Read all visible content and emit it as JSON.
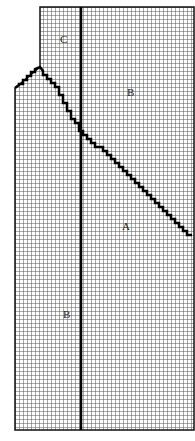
{
  "diagram": {
    "type": "grid-region-diagram",
    "grid": {
      "cell_size": 4,
      "line_color": "#555555",
      "background": "#ffffff",
      "outline_color": "#111111"
    },
    "outline_points": "40,7 194,7 194,430 15,430 15,88 40,67",
    "staircase": {
      "points": [
        [
          15,
          88
        ],
        [
          19,
          85
        ],
        [
          19,
          84
        ],
        [
          23,
          84
        ],
        [
          23,
          80
        ],
        [
          27,
          80
        ],
        [
          27,
          76
        ],
        [
          31,
          76
        ],
        [
          31,
          72
        ],
        [
          35,
          72
        ],
        [
          35,
          69
        ],
        [
          40,
          67
        ],
        [
          43,
          71
        ],
        [
          43,
          75
        ],
        [
          47,
          75
        ],
        [
          47,
          79
        ],
        [
          51,
          79
        ],
        [
          51,
          83
        ],
        [
          55,
          83
        ],
        [
          55,
          87
        ],
        [
          59,
          87
        ],
        [
          59,
          95
        ],
        [
          63,
          95
        ],
        [
          63,
          103
        ],
        [
          67,
          103
        ],
        [
          67,
          111
        ],
        [
          71,
          111
        ],
        [
          71,
          119
        ],
        [
          75,
          119
        ],
        [
          75,
          123
        ],
        [
          79,
          123
        ],
        [
          79,
          131
        ],
        [
          83,
          131
        ],
        [
          83,
          135
        ],
        [
          87,
          135
        ],
        [
          87,
          139
        ],
        [
          91,
          139
        ],
        [
          91,
          143
        ],
        [
          95,
          143
        ],
        [
          95,
          147
        ],
        [
          103,
          147
        ],
        [
          103,
          151
        ],
        [
          107,
          151
        ],
        [
          107,
          155
        ],
        [
          111,
          155
        ],
        [
          111,
          159
        ],
        [
          115,
          159
        ],
        [
          115,
          163
        ],
        [
          119,
          163
        ],
        [
          119,
          167
        ],
        [
          123,
          167
        ],
        [
          123,
          171
        ],
        [
          127,
          171
        ],
        [
          127,
          175
        ],
        [
          131,
          175
        ],
        [
          131,
          179
        ],
        [
          135,
          179
        ],
        [
          135,
          183
        ],
        [
          139,
          183
        ],
        [
          139,
          187
        ],
        [
          143,
          187
        ],
        [
          143,
          191
        ],
        [
          147,
          191
        ],
        [
          147,
          195
        ],
        [
          151,
          195
        ],
        [
          151,
          199
        ],
        [
          155,
          199
        ],
        [
          155,
          203
        ],
        [
          159,
          203
        ],
        [
          159,
          207
        ],
        [
          163,
          207
        ],
        [
          163,
          211
        ],
        [
          167,
          211
        ],
        [
          167,
          215
        ],
        [
          171,
          215
        ],
        [
          171,
          219
        ],
        [
          175,
          219
        ],
        [
          175,
          223
        ],
        [
          179,
          223
        ],
        [
          179,
          227
        ],
        [
          183,
          227
        ],
        [
          183,
          231
        ],
        [
          187,
          231
        ],
        [
          187,
          235
        ],
        [
          192,
          235
        ]
      ],
      "color": "#000000",
      "width": 2.5
    },
    "divider_line": {
      "x": 81,
      "y1": 7,
      "y2": 430,
      "color": "#000000",
      "width": 2.5
    },
    "labels": [
      {
        "id": "C",
        "text": "C",
        "x": 60,
        "y": 43
      },
      {
        "id": "B-upper",
        "text": "B",
        "x": 127,
        "y": 96
      },
      {
        "id": "A",
        "text": "A",
        "x": 122,
        "y": 230
      },
      {
        "id": "B-lower",
        "text": "B",
        "x": 63,
        "y": 318
      }
    ]
  }
}
